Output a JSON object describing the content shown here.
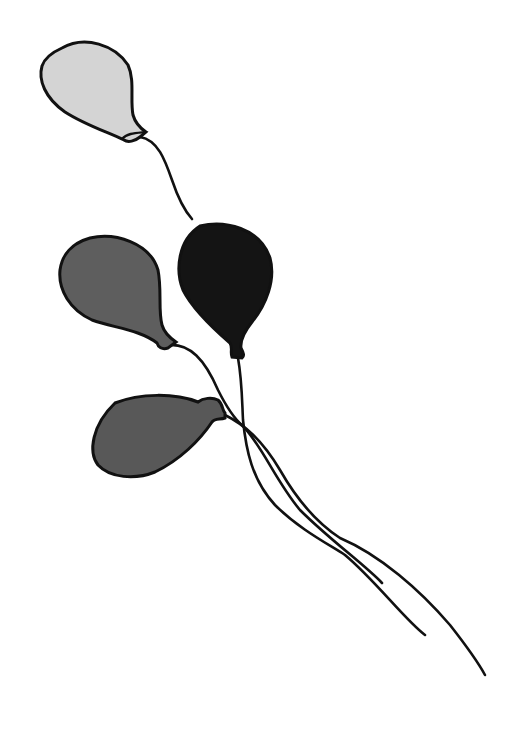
{
  "scene": {
    "description": "Line drawing of four balloons on strings",
    "background": "#ffffff",
    "outline_color": "#111111",
    "balloons": [
      {
        "name": "light-gray-balloon",
        "fill": "#d4d4d4"
      },
      {
        "name": "medium-gray-balloon",
        "fill": "#5e5e5e"
      },
      {
        "name": "black-balloon",
        "fill": "#141414"
      },
      {
        "name": "lower-gray-balloon",
        "fill": "#585858"
      }
    ]
  }
}
